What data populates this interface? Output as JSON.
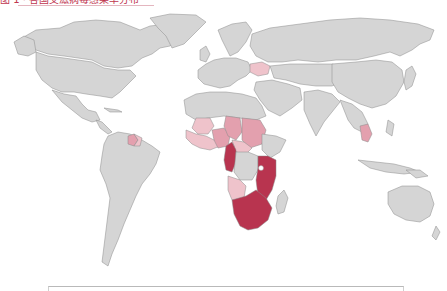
{
  "caption": {
    "text": "图 1 · 各国艾滋病毒感染率分布",
    "color": "#c0364f"
  },
  "map": {
    "projection": "world",
    "background": "#ffffff",
    "base_land_color": "#d5d5d5",
    "border_color": "#8a8a8a",
    "classes": [
      {
        "level": "high",
        "color": "#b8344f"
      },
      {
        "level": "medium",
        "color": "#e3a0ae"
      },
      {
        "level": "low",
        "color": "#efc3cb"
      }
    ],
    "highlighted_regions": [
      {
        "name": "South Africa",
        "level": "high"
      },
      {
        "name": "Namibia",
        "level": "high"
      },
      {
        "name": "Botswana",
        "level": "high"
      },
      {
        "name": "Zimbabwe",
        "level": "high"
      },
      {
        "name": "Zambia",
        "level": "high"
      },
      {
        "name": "Mozambique",
        "level": "high"
      },
      {
        "name": "Malawi",
        "level": "high"
      },
      {
        "name": "Tanzania",
        "level": "high"
      },
      {
        "name": "Kenya",
        "level": "high"
      },
      {
        "name": "Uganda",
        "level": "high"
      },
      {
        "name": "Lesotho",
        "level": "high"
      },
      {
        "name": "Eswatini",
        "level": "high"
      },
      {
        "name": "Cameroon",
        "level": "high"
      },
      {
        "name": "Gabon",
        "level": "high"
      },
      {
        "name": "Equatorial Guinea",
        "level": "high"
      },
      {
        "name": "Central African Republic",
        "level": "medium"
      },
      {
        "name": "Chad",
        "level": "medium"
      },
      {
        "name": "Sudan",
        "level": "medium"
      },
      {
        "name": "Nigeria",
        "level": "medium"
      },
      {
        "name": "Angola",
        "level": "medium"
      },
      {
        "name": "Congo",
        "level": "medium"
      },
      {
        "name": "Ghana",
        "level": "low"
      },
      {
        "name": "Cote d'Ivoire",
        "level": "low"
      },
      {
        "name": "Burkina Faso",
        "level": "low"
      },
      {
        "name": "Mali",
        "level": "low"
      },
      {
        "name": "Guinea",
        "level": "low"
      },
      {
        "name": "Sierra Leone",
        "level": "low"
      },
      {
        "name": "Liberia",
        "level": "low"
      },
      {
        "name": "Togo",
        "level": "low"
      },
      {
        "name": "Benin",
        "level": "low"
      },
      {
        "name": "Ukraine",
        "level": "low"
      },
      {
        "name": "Thailand",
        "level": "medium"
      },
      {
        "name": "Guyana",
        "level": "medium"
      },
      {
        "name": "Suriname",
        "level": "low"
      }
    ]
  },
  "legend": {
    "visible_partially": true
  }
}
